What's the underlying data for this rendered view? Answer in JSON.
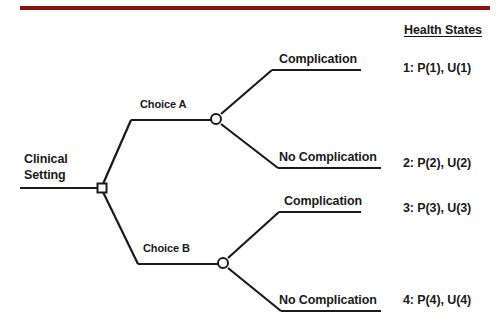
{
  "figure": {
    "type": "decision-tree",
    "accent_color": "#8c1111",
    "line_color": "#1a1a1a",
    "text_color": "#1a1a1a",
    "background": "#ffffff"
  },
  "header": {
    "health_states_title": "Health States"
  },
  "root": {
    "label_line1": "Clinical",
    "label_line2": "Setting",
    "node_type": "decision-square"
  },
  "branches": [
    {
      "choice_label": "Choice A",
      "node_type": "chance-circle",
      "outcomes": [
        {
          "label": "Complication",
          "health_state": "1: P(1), U(1)"
        },
        {
          "label": "No Complication",
          "health_state": "2: P(2), U(2)"
        }
      ]
    },
    {
      "choice_label": "Choice B",
      "node_type": "chance-circle",
      "outcomes": [
        {
          "label": "Complication",
          "health_state": "3: P(3), U(3)"
        },
        {
          "label": "No Complication",
          "health_state": "4: P(4), U(4)"
        }
      ]
    }
  ]
}
